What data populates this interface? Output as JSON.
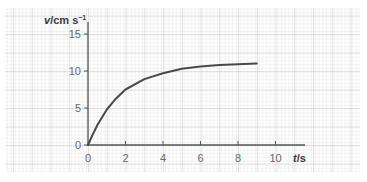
{
  "chart_data": {
    "type": "line",
    "title": "",
    "xlabel": "t/s",
    "ylabel": "v/cm s⁻¹",
    "xlim": [
      0,
      10
    ],
    "ylim": [
      0,
      15
    ],
    "x_ticks": [
      0,
      2,
      4,
      6,
      8,
      10
    ],
    "y_ticks": [
      0,
      5,
      10,
      15
    ],
    "grid": true,
    "legend": null,
    "series": [
      {
        "name": "velocity",
        "x": [
          0,
          0.25,
          0.5,
          1,
          1.5,
          2,
          3,
          4,
          5,
          6,
          7,
          8,
          9
        ],
        "values": [
          0,
          1.4,
          2.7,
          4.8,
          6.3,
          7.5,
          8.9,
          9.7,
          10.3,
          10.6,
          10.8,
          10.9,
          11.0
        ]
      }
    ]
  },
  "labels": {
    "y_axis_var": "v",
    "y_axis_unit": "/cm s",
    "y_axis_exp": "−1",
    "x_axis_var": "t",
    "x_axis_unit": "/s",
    "x_tick_0": "0",
    "x_tick_2": "2",
    "x_tick_4": "4",
    "x_tick_6": "6",
    "x_tick_8": "8",
    "x_tick_10": "10",
    "y_tick_0": "0",
    "y_tick_5": "5",
    "y_tick_10": "10",
    "y_tick_15": "15"
  },
  "colors": {
    "grid_minor": "#d4d4d4",
    "grid_major": "#b8b8b8",
    "axis": "#555555",
    "curve": "#4a4a4a"
  }
}
